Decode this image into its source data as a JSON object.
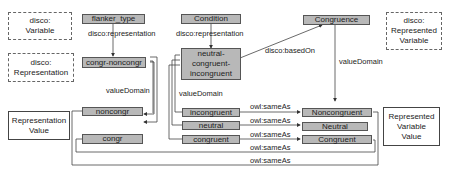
{
  "nodes": {
    "disco_variable": "disco:\nVariable",
    "disco_representation": "disco:\nRepresentation",
    "representation_value": "Representation\nValue",
    "disco_represented_variable": "disco:\nRepresented\nVariable",
    "represented_variable_value": "Represented\nVariable\nValue",
    "flanker_type": "flanker_type",
    "congr_noncongr": "congr-noncongr",
    "noncongr": "noncongr",
    "congr": "congr",
    "condition": "Condition",
    "neutral_congruent_incongruent": "neutral-\ncongruent-\nincongruent",
    "incongruent": "incongruent",
    "neutral": "neutral",
    "congruent": "congruent",
    "congruence": "Congruence",
    "Noncongruent": "Noncongruent",
    "Neutral": "Neutral",
    "Congruent": "Congruent"
  },
  "edges": {
    "flanker_repr": "disco:representation",
    "condition_repr": "disco:representation",
    "based_on": "disco:basedOn",
    "vd_left": "valueDomain",
    "vd_mid": "valueDomain",
    "vd_right": "valueDomain",
    "same1": "owl:sameAs",
    "same2": "owl:sameAs",
    "same3": "owl:sameAs",
    "same4": "owl:sameAs",
    "same5": "owl:sameAs"
  }
}
